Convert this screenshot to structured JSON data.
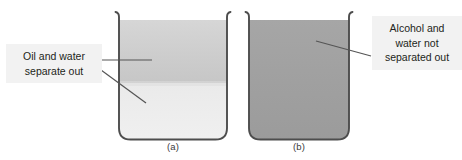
{
  "figure": {
    "background_color": "#ffffff",
    "beakers": [
      {
        "id": "beaker-a",
        "caption": "(a)",
        "outline_color": "#4d4d4d",
        "layers": [
          {
            "name": "oil-layer",
            "label": "oil",
            "color": "#cfcfcf",
            "position": "upper"
          },
          {
            "name": "water-layer",
            "label": "water",
            "color": "#ededed",
            "position": "lower"
          }
        ]
      },
      {
        "id": "beaker-b",
        "caption": "(b)",
        "outline_color": "#4d4d4d",
        "layers": [
          {
            "name": "alcohol-water-mixture",
            "label": "alcohol and water mixture",
            "color": "#a0a0a0",
            "position": "full"
          }
        ]
      }
    ],
    "callouts": [
      {
        "id": "callout-left",
        "text": "Oil and water\nseparate out",
        "background_color": "#f2f2f2",
        "text_color": "#231f20",
        "leader_count": 2
      },
      {
        "id": "callout-right",
        "text": "Alcohol and\nwater not\nseparated out",
        "background_color": "#f2f2f2",
        "text_color": "#231f20",
        "leader_count": 1
      }
    ],
    "leader_line_color": "#555555"
  }
}
